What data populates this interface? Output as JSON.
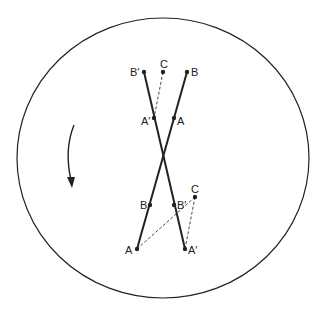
{
  "diagram": {
    "circle": {
      "cx": 163,
      "cy": 158,
      "rx": 146,
      "ry": 140
    },
    "colors": {
      "stroke": "#222222",
      "background": "#ffffff"
    },
    "rotation_arrow": {
      "direction": "counterclockwise-downward",
      "icon": "curved-arrow-icon"
    },
    "upper": {
      "points": {
        "B_prime": {
          "label": "B′",
          "x": 144,
          "y": 72
        },
        "C": {
          "label": "C",
          "x": 163,
          "y": 72
        },
        "B": {
          "label": "B",
          "x": 187,
          "y": 72
        },
        "A_prime": {
          "label": "A′",
          "x": 154,
          "y": 118
        },
        "A": {
          "label": "A",
          "x": 174,
          "y": 118
        }
      }
    },
    "lower": {
      "points": {
        "B": {
          "label": "B",
          "x": 150,
          "y": 205
        },
        "B_prime": {
          "label": "B′",
          "x": 174,
          "y": 205
        },
        "C": {
          "label": "C",
          "x": 195,
          "y": 197
        },
        "A": {
          "label": "A",
          "x": 137,
          "y": 249
        },
        "A_prime": {
          "label": "A′",
          "x": 185,
          "y": 249
        }
      }
    }
  }
}
